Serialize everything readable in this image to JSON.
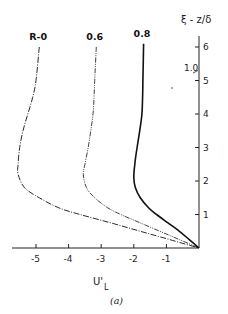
{
  "chart_data": {
    "type": "line",
    "title": "",
    "caption": "(a)",
    "xlabel": "U'",
    "xlabel_sub": "L",
    "ylabel": "ξ - z/δ",
    "xlim": [
      -5.8,
      0
    ],
    "ylim": [
      0,
      6.3
    ],
    "x_ticks": [
      -5,
      -4,
      -3,
      -2,
      -1
    ],
    "x_tick_labels": [
      "-5",
      "-4",
      "-3",
      "-2",
      "-1"
    ],
    "y_ticks": [
      1,
      2,
      3,
      4,
      5,
      6
    ],
    "y_tick_labels": [
      "1",
      "2",
      "3",
      "4",
      "5",
      "6"
    ],
    "grid": false,
    "legend": "inline labels at top of each curve",
    "annotations": [
      {
        "text": "1.0",
        "points_to": {
          "x": 0,
          "y": 5.3
        },
        "meaning": "R=1.0 curve coincides with vertical axis"
      }
    ],
    "series": [
      {
        "name": "R-0",
        "style": "dash-dot",
        "y": [
          6.0,
          5.0,
          4.5,
          4.0,
          3.5,
          3.0,
          2.5,
          2.2,
          1.8,
          1.5,
          1.2,
          1.0,
          0.75,
          0.5,
          0.25,
          0.0
        ],
        "x": [
          -4.9,
          -5.0,
          -5.1,
          -5.25,
          -5.4,
          -5.5,
          -5.55,
          -5.55,
          -5.35,
          -4.9,
          -4.3,
          -3.65,
          -2.7,
          -1.8,
          -0.9,
          0.0
        ]
      },
      {
        "name": "0.6",
        "style": "dash-dot-dot",
        "y": [
          6.0,
          5.0,
          4.5,
          4.0,
          3.5,
          3.0,
          2.5,
          2.2,
          1.8,
          1.5,
          1.2,
          1.0,
          0.75,
          0.5,
          0.25,
          0.0
        ],
        "x": [
          -3.15,
          -3.2,
          -3.22,
          -3.25,
          -3.32,
          -3.4,
          -3.5,
          -3.55,
          -3.45,
          -3.2,
          -2.8,
          -2.4,
          -1.8,
          -1.2,
          -0.6,
          0.0
        ]
      },
      {
        "name": "0.8",
        "style": "solid",
        "y": [
          6.1,
          5.0,
          4.5,
          4.0,
          3.5,
          3.0,
          2.5,
          2.1,
          1.8,
          1.5,
          1.2,
          1.0,
          0.75,
          0.5,
          0.25,
          0.0
        ],
        "x": [
          -1.7,
          -1.72,
          -1.73,
          -1.75,
          -1.82,
          -1.9,
          -1.97,
          -2.0,
          -1.95,
          -1.8,
          -1.55,
          -1.3,
          -0.95,
          -0.6,
          -0.3,
          0.0
        ]
      }
    ]
  }
}
